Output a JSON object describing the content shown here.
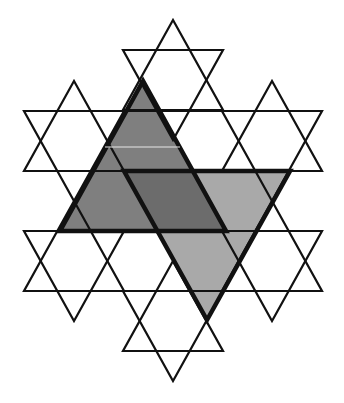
{
  "diagram": {
    "title": "Hexagram lattice with two overlapping shaded triangles",
    "colors": {
      "background": "#ffffff",
      "stroke": "#111111",
      "dark_fill": "#7f7f7f",
      "light_fill": "#a9a9a9",
      "overlap_fill": "#6c6c6c"
    },
    "star_radius": 60,
    "star_half_width": 50,
    "stars": [
      {
        "name": "top",
        "cx": 173,
        "cy": 80
      },
      {
        "name": "middle-left",
        "cx": 74,
        "cy": 141
      },
      {
        "name": "middle-right",
        "cx": 272,
        "cy": 141
      },
      {
        "name": "lower-left",
        "cx": 74,
        "cy": 261
      },
      {
        "name": "lower-right",
        "cx": 272,
        "cy": 261
      },
      {
        "name": "bottom",
        "cx": 173,
        "cy": 321
      }
    ],
    "long_lines": [
      {
        "y": 111,
        "x1": 24,
        "x2": 322
      },
      {
        "y": 171,
        "x1": 24,
        "x2": 322
      },
      {
        "y": 231,
        "x1": 24,
        "x2": 322
      },
      {
        "y": 291,
        "x1": 24,
        "x2": 322
      }
    ],
    "shaded_triangles": [
      {
        "name": "dark-up-triangle",
        "direction": "up",
        "points": [
          [
            143,
            81
          ],
          [
            60,
            231
          ],
          [
            226,
            231
          ]
        ]
      },
      {
        "name": "light-down-triangle",
        "direction": "down",
        "points": [
          [
            124,
            171
          ],
          [
            290,
            171
          ],
          [
            207,
            320
          ]
        ]
      }
    ]
  }
}
